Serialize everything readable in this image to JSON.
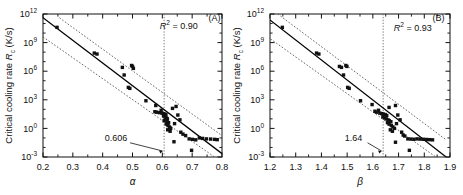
{
  "figure": {
    "type": "two-panel-scatter",
    "background": "#ffffff",
    "marker_color": "#111111",
    "line_color": "#000000",
    "band_color": "#555555"
  },
  "panels": [
    {
      "tag": "(A)",
      "r2_label": "R",
      "r2_sup": "2",
      "r2_value": "= 0.90",
      "threshold_label": "0.606",
      "xlabel": "α",
      "ylabel_pre": "Critical cooling rate ",
      "ylabel_italic": "R",
      "ylabel_sub": "c",
      "ylabel_post": " (K/s)",
      "xticks": [
        "0.2",
        "0.3",
        "0.4",
        "0.5",
        "0.6",
        "0.7",
        "0.8"
      ],
      "yticks": [
        "10",
        "10",
        "10",
        "10",
        "10",
        "10"
      ],
      "yexps": [
        "-3",
        "0",
        "3",
        "6",
        "9",
        "12"
      ]
    },
    {
      "tag": "(B)",
      "r2_label": "R",
      "r2_sup": "2",
      "r2_value": "= 0.93",
      "threshold_label": "1.64",
      "xlabel": "β",
      "ylabel_pre": "Critical cooling rate ",
      "ylabel_italic": "R",
      "ylabel_sub": "c",
      "ylabel_post": " (K/s)",
      "xticks": [
        "1.2",
        "1.3",
        "1.4",
        "1.5",
        "1.6",
        "1.7",
        "1.8",
        "1.9"
      ],
      "yticks": [
        "10",
        "10",
        "10",
        "10",
        "10",
        "10"
      ],
      "yexps": [
        "-3",
        "0",
        "3",
        "6",
        "9",
        "12"
      ]
    }
  ],
  "chart_data": [
    {
      "type": "scatter",
      "panel": "(A)",
      "title": "",
      "xlabel": "α",
      "ylabel": "Critical cooling rate Rc (K/s)",
      "xlim": [
        0.2,
        0.8
      ],
      "ylim_log10": [
        -3,
        12
      ],
      "yscale": "log",
      "grid": false,
      "legend": "none",
      "annotations": [
        {
          "text": "R2 = 0.90",
          "x": 0.655,
          "y_log10": 10.4
        },
        {
          "text": "(A)",
          "x": 0.775,
          "y_log10": 11.3
        },
        {
          "text": "0.606",
          "x": 0.445,
          "y_log10": -1.3
        }
      ],
      "vline": {
        "x": 0.606,
        "style": "dotted"
      },
      "fit_line": {
        "x": [
          0.2,
          0.815
        ],
        "y_log10": [
          11.6,
          -3.0
        ],
        "style": "solid"
      },
      "upper_band": {
        "x": [
          0.255,
          0.815
        ],
        "y_log10": [
          11.6,
          -1.1
        ],
        "style": "dotted"
      },
      "lower_band": {
        "x": [
          0.2,
          0.775
        ],
        "y_log10": [
          9.6,
          -3.0
        ],
        "style": "dotted"
      },
      "points": [
        {
          "x": 0.247,
          "y_log10": 10.6
        },
        {
          "x": 0.372,
          "y_log10": 7.9
        },
        {
          "x": 0.381,
          "y_log10": 7.8
        },
        {
          "x": 0.466,
          "y_log10": 6.4
        },
        {
          "x": 0.472,
          "y_log10": 5.6
        },
        {
          "x": 0.497,
          "y_log10": 6.6
        },
        {
          "x": 0.5,
          "y_log10": 6.5
        },
        {
          "x": 0.503,
          "y_log10": 6.3
        },
        {
          "x": 0.486,
          "y_log10": 4.3
        },
        {
          "x": 0.491,
          "y_log10": 4.2
        },
        {
          "x": 0.545,
          "y_log10": 2.9
        },
        {
          "x": 0.578,
          "y_log10": 2.4
        },
        {
          "x": 0.596,
          "y_log10": 1.9
        },
        {
          "x": 0.575,
          "y_log10": 1.75
        },
        {
          "x": 0.581,
          "y_log10": 1.7
        },
        {
          "x": 0.59,
          "y_log10": 1.65
        },
        {
          "x": 0.599,
          "y_log10": 1.6
        },
        {
          "x": 0.604,
          "y_log10": 1.55
        },
        {
          "x": 0.608,
          "y_log10": 1.5
        },
        {
          "x": 0.612,
          "y_log10": 1.45
        },
        {
          "x": 0.604,
          "y_log10": 1.3
        },
        {
          "x": 0.609,
          "y_log10": 1.2
        },
        {
          "x": 0.614,
          "y_log10": 1.1
        },
        {
          "x": 0.617,
          "y_log10": 1.0
        },
        {
          "x": 0.611,
          "y_log10": 0.9
        },
        {
          "x": 0.606,
          "y_log10": 0.8
        },
        {
          "x": 0.616,
          "y_log10": 0.7
        },
        {
          "x": 0.621,
          "y_log10": 0.6
        },
        {
          "x": 0.613,
          "y_log10": 0.45
        },
        {
          "x": 0.619,
          "y_log10": 0.3
        },
        {
          "x": 0.624,
          "y_log10": 0.15
        },
        {
          "x": 0.628,
          "y_log10": 0.0
        },
        {
          "x": 0.618,
          "y_log10": -0.15
        },
        {
          "x": 0.626,
          "y_log10": -0.3
        },
        {
          "x": 0.634,
          "y_log10": 2.1
        },
        {
          "x": 0.646,
          "y_log10": 2.3
        },
        {
          "x": 0.652,
          "y_log10": 1.4
        },
        {
          "x": 0.659,
          "y_log10": 0.9
        },
        {
          "x": 0.641,
          "y_log10": 0.5
        },
        {
          "x": 0.662,
          "y_log10": -0.4
        },
        {
          "x": 0.669,
          "y_log10": -0.6
        },
        {
          "x": 0.678,
          "y_log10": -0.75
        },
        {
          "x": 0.69,
          "y_log10": -1.1
        },
        {
          "x": 0.701,
          "y_log10": -1.15
        },
        {
          "x": 0.712,
          "y_log10": -1.2
        },
        {
          "x": 0.724,
          "y_log10": -1.0
        },
        {
          "x": 0.735,
          "y_log10": -1.05
        },
        {
          "x": 0.748,
          "y_log10": -1.1
        },
        {
          "x": 0.762,
          "y_log10": -1.12
        },
        {
          "x": 0.775,
          "y_log10": -1.15
        },
        {
          "x": 0.784,
          "y_log10": -1.18
        },
        {
          "x": 0.698,
          "y_log10": -2.3
        },
        {
          "x": 0.639,
          "y_log10": -1.4
        }
      ]
    },
    {
      "type": "scatter",
      "panel": "(B)",
      "title": "",
      "xlabel": "β",
      "ylabel": "Critical cooling rate Rc (K/s)",
      "xlim": [
        1.2,
        1.9
      ],
      "ylim_log10": [
        -3,
        12
      ],
      "yscale": "log",
      "grid": false,
      "legend": "none",
      "annotations": [
        {
          "text": "R2 = 0.93",
          "x": 1.755,
          "y_log10": 10.2
        },
        {
          "text": "(B)",
          "x": 1.855,
          "y_log10": 11.3
        },
        {
          "text": "1.64",
          "x": 1.525,
          "y_log10": -1.3
        }
      ],
      "vline": {
        "x": 1.64,
        "style": "dotted"
      },
      "fit_line": {
        "x": [
          1.17,
          1.885
        ],
        "y_log10": [
          12.0,
          -3.0
        ],
        "style": "solid"
      },
      "upper_band": {
        "x": [
          1.23,
          1.885
        ],
        "y_log10": [
          12.0,
          -1.2
        ],
        "style": "dotted"
      },
      "lower_band": {
        "x": [
          1.17,
          1.845
        ],
        "y_log10": [
          10.0,
          -3.0
        ],
        "style": "dotted"
      },
      "points": [
        {
          "x": 1.248,
          "y_log10": 10.6
        },
        {
          "x": 1.381,
          "y_log10": 7.9
        },
        {
          "x": 1.39,
          "y_log10": 7.8
        },
        {
          "x": 1.47,
          "y_log10": 6.5
        },
        {
          "x": 1.478,
          "y_log10": 6.4
        },
        {
          "x": 1.495,
          "y_log10": 6.6
        },
        {
          "x": 1.499,
          "y_log10": 6.5
        },
        {
          "x": 1.486,
          "y_log10": 5.6
        },
        {
          "x": 1.502,
          "y_log10": 4.3
        },
        {
          "x": 1.508,
          "y_log10": 4.2
        },
        {
          "x": 1.552,
          "y_log10": 2.9
        },
        {
          "x": 1.597,
          "y_log10": 2.5
        },
        {
          "x": 1.622,
          "y_log10": 1.9
        },
        {
          "x": 1.608,
          "y_log10": 1.8
        },
        {
          "x": 1.614,
          "y_log10": 1.7
        },
        {
          "x": 1.627,
          "y_log10": 1.6
        },
        {
          "x": 1.635,
          "y_log10": 1.55
        },
        {
          "x": 1.641,
          "y_log10": 1.5
        },
        {
          "x": 1.648,
          "y_log10": 1.45
        },
        {
          "x": 1.654,
          "y_log10": 1.35
        },
        {
          "x": 1.639,
          "y_log10": 1.2
        },
        {
          "x": 1.646,
          "y_log10": 1.1
        },
        {
          "x": 1.652,
          "y_log10": 1.0
        },
        {
          "x": 1.659,
          "y_log10": 0.9
        },
        {
          "x": 1.664,
          "y_log10": 0.8
        },
        {
          "x": 1.67,
          "y_log10": 0.7
        },
        {
          "x": 1.657,
          "y_log10": 0.6
        },
        {
          "x": 1.663,
          "y_log10": 0.45
        },
        {
          "x": 1.672,
          "y_log10": 0.3
        },
        {
          "x": 1.678,
          "y_log10": 0.15
        },
        {
          "x": 1.684,
          "y_log10": 0.0
        },
        {
          "x": 1.668,
          "y_log10": -0.15
        },
        {
          "x": 1.676,
          "y_log10": -0.3
        },
        {
          "x": 1.663,
          "y_log10": 2.2
        },
        {
          "x": 1.688,
          "y_log10": 2.4
        },
        {
          "x": 1.697,
          "y_log10": 1.4
        },
        {
          "x": 1.706,
          "y_log10": 0.9
        },
        {
          "x": 1.692,
          "y_log10": 0.5
        },
        {
          "x": 1.712,
          "y_log10": -0.4
        },
        {
          "x": 1.718,
          "y_log10": -0.7
        },
        {
          "x": 1.724,
          "y_log10": -0.8
        },
        {
          "x": 1.736,
          "y_log10": -1.1
        },
        {
          "x": 1.748,
          "y_log10": -1.12
        },
        {
          "x": 1.76,
          "y_log10": -1.14
        },
        {
          "x": 1.772,
          "y_log10": -1.1
        },
        {
          "x": 1.784,
          "y_log10": -1.12
        },
        {
          "x": 1.796,
          "y_log10": -1.14
        },
        {
          "x": 1.808,
          "y_log10": -1.16
        },
        {
          "x": 1.82,
          "y_log10": -1.18
        },
        {
          "x": 1.832,
          "y_log10": -1.2
        },
        {
          "x": 1.742,
          "y_log10": -2.3
        },
        {
          "x": 1.688,
          "y_log10": -1.45
        }
      ]
    }
  ]
}
